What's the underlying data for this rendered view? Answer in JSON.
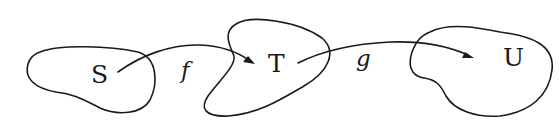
{
  "diagram": {
    "type": "function-composition",
    "sets": [
      {
        "id": "S",
        "label": "S"
      },
      {
        "id": "T",
        "label": "T"
      },
      {
        "id": "U",
        "label": "U"
      }
    ],
    "maps": [
      {
        "id": "f",
        "label": "f",
        "from": "S",
        "to": "T"
      },
      {
        "id": "g",
        "label": "g",
        "from": "T",
        "to": "U"
      }
    ],
    "stroke_color": "#1a1a1a",
    "background_color": "#ffffff"
  }
}
